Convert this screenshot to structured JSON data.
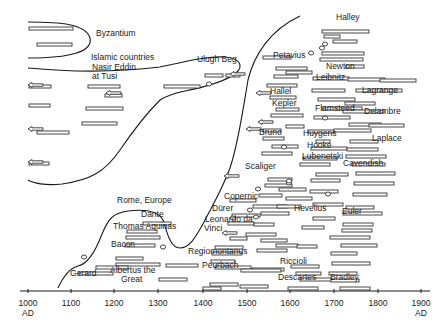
{
  "diagram": {
    "type": "timeline",
    "regions": [
      {
        "name": "Byzantium"
      },
      {
        "name": "Islamic countries"
      },
      {
        "name": "Rome, Europe"
      }
    ],
    "axis": {
      "ticks": [
        {
          "label": "1000",
          "sub": "AD",
          "x": 28
        },
        {
          "label": "1100",
          "sub": "",
          "x": 71
        },
        {
          "label": "1200",
          "sub": "",
          "x": 114
        },
        {
          "label": "1300",
          "sub": "",
          "x": 158
        },
        {
          "label": "1400",
          "sub": "",
          "x": 203
        },
        {
          "label": "1500",
          "sub": "",
          "x": 247
        },
        {
          "label": "1600",
          "sub": "",
          "x": 290
        },
        {
          "label": "1700",
          "sub": "",
          "x": 334
        },
        {
          "label": "1800",
          "sub": "",
          "x": 378
        },
        {
          "label": "1900",
          "sub": "AD",
          "x": 421
        }
      ]
    },
    "labels": [
      {
        "text": "Byzantium",
        "x": 96,
        "y": 36
      },
      {
        "text": "Islamic countries",
        "x": 91,
        "y": 60
      },
      {
        "text": "Nasir Eddin",
        "x": 92,
        "y": 70
      },
      {
        "text": "at Tusi",
        "x": 92,
        "y": 79
      },
      {
        "text": "Ulugh Beg",
        "x": 197,
        "y": 62
      },
      {
        "text": "Halley",
        "x": 336,
        "y": 20
      },
      {
        "text": "Petavius",
        "x": 273,
        "y": 58
      },
      {
        "text": "Newton",
        "x": 326,
        "y": 69
      },
      {
        "text": "Leibnitz",
        "x": 316,
        "y": 80
      },
      {
        "text": "Lagrange",
        "x": 362,
        "y": 93
      },
      {
        "text": "Hallel",
        "x": 270,
        "y": 94
      },
      {
        "text": "Kepler",
        "x": 272,
        "y": 106
      },
      {
        "text": "Flamsteed",
        "x": 315,
        "y": 111
      },
      {
        "text": "Delambre",
        "x": 364,
        "y": 114
      },
      {
        "text": "Bruno",
        "x": 259,
        "y": 135
      },
      {
        "text": "Huygens",
        "x": 303,
        "y": 136
      },
      {
        "text": "Laplace",
        "x": 372,
        "y": 141
      },
      {
        "text": "Hooke",
        "x": 307,
        "y": 148
      },
      {
        "text": "Lubenetski",
        "x": 302,
        "y": 159
      },
      {
        "text": "Scaliger",
        "x": 245,
        "y": 169
      },
      {
        "text": "Cavendish",
        "x": 343,
        "y": 166
      },
      {
        "text": "Copernic",
        "x": 224,
        "y": 199
      },
      {
        "text": "Dürer",
        "x": 212,
        "y": 211
      },
      {
        "text": "Hevelius",
        "x": 294,
        "y": 211
      },
      {
        "text": "Euler",
        "x": 342,
        "y": 214
      },
      {
        "text": "Leonardo da",
        "x": 205,
        "y": 222
      },
      {
        "text": "Vinci",
        "x": 204,
        "y": 231
      },
      {
        "text": "Rome, Europe",
        "x": 117,
        "y": 203
      },
      {
        "text": "Dante",
        "x": 141,
        "y": 217
      },
      {
        "text": "Thomas Aquinas",
        "x": 113,
        "y": 229
      },
      {
        "text": "Bacon",
        "x": 111,
        "y": 247
      },
      {
        "text": "Regiomontanus",
        "x": 188,
        "y": 254
      },
      {
        "text": "Riccioli",
        "x": 280,
        "y": 264
      },
      {
        "text": "Peurbach",
        "x": 202,
        "y": 268
      },
      {
        "text": "Descartes",
        "x": 278,
        "y": 280
      },
      {
        "text": "Bradley",
        "x": 330,
        "y": 280
      },
      {
        "text": "Gerard",
        "x": 70,
        "y": 276
      },
      {
        "text": "Albertus the",
        "x": 110,
        "y": 273
      },
      {
        "text": "Great",
        "x": 121,
        "y": 282
      }
    ],
    "bars": [
      [
        29,
        27,
        44
      ],
      [
        37,
        43,
        35
      ],
      [
        29,
        85,
        22
      ],
      [
        88,
        85,
        32
      ],
      [
        164,
        85,
        36
      ],
      [
        29,
        104,
        21
      ],
      [
        86,
        107,
        37
      ],
      [
        82,
        122,
        35
      ],
      [
        37,
        131,
        32
      ],
      [
        29,
        162,
        20
      ],
      [
        105,
        94,
        17
      ],
      [
        205,
        74,
        18
      ],
      [
        226,
        74,
        14
      ],
      [
        322,
        30,
        47
      ],
      [
        324,
        35,
        16
      ],
      [
        333,
        40,
        24
      ],
      [
        322,
        52,
        42
      ],
      [
        320,
        58,
        43
      ],
      [
        346,
        65,
        18
      ],
      [
        263,
        56,
        28
      ],
      [
        276,
        67,
        31
      ],
      [
        286,
        71,
        26
      ],
      [
        274,
        75,
        24
      ],
      [
        313,
        77,
        36
      ],
      [
        348,
        78,
        37
      ],
      [
        380,
        79,
        36
      ],
      [
        267,
        84,
        30
      ],
      [
        312,
        89,
        33
      ],
      [
        356,
        89,
        46
      ],
      [
        270,
        96,
        26
      ],
      [
        318,
        98,
        37
      ],
      [
        345,
        102,
        30
      ],
      [
        276,
        108,
        23
      ],
      [
        322,
        107,
        40
      ],
      [
        343,
        110,
        41
      ],
      [
        271,
        114,
        32
      ],
      [
        314,
        116,
        36
      ],
      [
        349,
        123,
        32
      ],
      [
        286,
        125,
        18
      ],
      [
        263,
        129,
        18
      ],
      [
        308,
        130,
        26
      ],
      [
        334,
        129,
        37
      ],
      [
        369,
        124,
        35
      ],
      [
        263,
        137,
        21
      ],
      [
        316,
        140,
        14
      ],
      [
        350,
        140,
        28
      ],
      [
        272,
        145,
        26
      ],
      [
        311,
        147,
        36
      ],
      [
        347,
        148,
        31
      ],
      [
        262,
        152,
        30
      ],
      [
        303,
        157,
        34
      ],
      [
        346,
        155,
        40
      ],
      [
        300,
        163,
        30
      ],
      [
        352,
        163,
        33
      ],
      [
        268,
        178,
        24
      ],
      [
        316,
        173,
        32
      ],
      [
        356,
        172,
        39
      ],
      [
        265,
        184,
        27
      ],
      [
        311,
        179,
        29
      ],
      [
        354,
        182,
        40
      ],
      [
        259,
        194,
        23
      ],
      [
        286,
        197,
        26
      ],
      [
        230,
        199,
        26
      ],
      [
        279,
        188,
        27
      ],
      [
        310,
        190,
        28
      ],
      [
        353,
        193,
        34
      ],
      [
        253,
        205,
        34
      ],
      [
        277,
        205,
        24
      ],
      [
        313,
        203,
        30
      ],
      [
        346,
        206,
        28
      ],
      [
        261,
        212,
        28
      ],
      [
        343,
        212,
        39
      ],
      [
        232,
        214,
        28
      ],
      [
        313,
        217,
        22
      ],
      [
        228,
        222,
        26
      ],
      [
        343,
        223,
        30
      ],
      [
        342,
        229,
        30
      ],
      [
        246,
        233,
        30
      ],
      [
        261,
        239,
        26
      ],
      [
        330,
        236,
        40
      ],
      [
        230,
        237,
        17
      ],
      [
        254,
        223,
        20
      ],
      [
        302,
        226,
        22
      ],
      [
        276,
        244,
        22
      ],
      [
        215,
        246,
        28
      ],
      [
        257,
        249,
        30
      ],
      [
        297,
        245,
        20
      ],
      [
        212,
        252,
        30
      ],
      [
        331,
        252,
        26
      ],
      [
        341,
        244,
        36
      ],
      [
        332,
        262,
        38
      ],
      [
        291,
        265,
        28
      ],
      [
        329,
        272,
        28
      ],
      [
        252,
        268,
        32
      ],
      [
        296,
        272,
        25
      ],
      [
        211,
        260,
        24
      ],
      [
        215,
        266,
        36
      ],
      [
        241,
        269,
        40
      ],
      [
        300,
        278,
        32
      ],
      [
        331,
        279,
        28
      ],
      [
        210,
        283,
        28
      ],
      [
        240,
        285,
        28
      ],
      [
        203,
        287,
        18
      ],
      [
        288,
        287,
        30
      ],
      [
        340,
        287,
        30
      ],
      [
        143,
        222,
        28
      ],
      [
        127,
        230,
        30
      ],
      [
        126,
        236,
        34
      ],
      [
        125,
        244,
        30
      ],
      [
        116,
        257,
        27
      ],
      [
        116,
        263,
        44
      ],
      [
        166,
        264,
        32
      ],
      [
        96,
        266,
        32
      ],
      [
        79,
        272,
        34
      ],
      [
        159,
        278,
        28
      ]
    ],
    "circles": [
      [
        209,
        84
      ],
      [
        325,
        44
      ],
      [
        322,
        48
      ],
      [
        311,
        53
      ],
      [
        325,
        118
      ],
      [
        289,
        183
      ],
      [
        284,
        147
      ],
      [
        289,
        181
      ],
      [
        258,
        189
      ],
      [
        328,
        194
      ],
      [
        256,
        217
      ],
      [
        163,
        247
      ],
      [
        84,
        257
      ],
      [
        250,
        210
      ],
      [
        233,
        218
      ]
    ],
    "arrows": [
      [
        35,
        85
      ],
      [
        35,
        129
      ],
      [
        35,
        162
      ],
      [
        113,
        93
      ],
      [
        237,
        74
      ],
      [
        231,
        176
      ],
      [
        253,
        129
      ],
      [
        265,
        122
      ],
      [
        229,
        233
      ],
      [
        263,
        93
      ]
    ]
  }
}
